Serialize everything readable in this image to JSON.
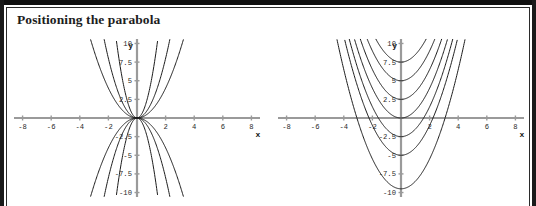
{
  "figure": {
    "title": "Positioning the parabola",
    "background_color": "#ffffff",
    "frame_color": "#101010",
    "axis_color": "#9a9a9a",
    "curve_color": "#1c1c1c"
  },
  "chart_data": [
    {
      "type": "line",
      "id": "left-plot",
      "title": "",
      "xlabel": "x",
      "ylabel": "y",
      "xlim": [
        -8.6,
        8.6
      ],
      "ylim": [
        -10.6,
        10.6
      ],
      "grid": false,
      "legend": "none",
      "xticks": [
        -8,
        -6,
        -4,
        -2,
        2,
        4,
        6,
        8
      ],
      "xtick_labels": [
        "-8",
        "-6",
        "-4",
        "-2",
        "2",
        "4",
        "6",
        "8"
      ],
      "yticks": [
        10,
        7.5,
        5,
        2.5,
        -2.5,
        -5,
        -7.5,
        -10
      ],
      "ytick_labels": [
        "10",
        "7.5",
        "5",
        "2.5",
        "-2.5",
        "-5",
        "-7.5",
        "-10"
      ],
      "description": "Family of parabolas y = a*x^2 through the origin, with both positive and negative coefficients a.",
      "series": [
        {
          "name": "y = 5x^2",
          "form": "a*x^2",
          "a": 5,
          "values": []
        },
        {
          "name": "y = 2x^2",
          "form": "a*x^2",
          "a": 2,
          "values": []
        },
        {
          "name": "y = x^2",
          "form": "a*x^2",
          "a": 1,
          "values": []
        },
        {
          "name": "y = -x^2",
          "form": "a*x^2",
          "a": -1,
          "values": []
        },
        {
          "name": "y = -2x^2",
          "form": "a*x^2",
          "a": -2,
          "values": []
        },
        {
          "name": "y = -5x^2",
          "form": "a*x^2",
          "a": -5,
          "values": []
        }
      ]
    },
    {
      "type": "line",
      "id": "right-plot",
      "title": "",
      "xlabel": "x",
      "ylabel": "y",
      "xlim": [
        -8.6,
        8.6
      ],
      "ylim": [
        -10.6,
        10.6
      ],
      "grid": false,
      "legend": "none",
      "xticks": [
        -8,
        -6,
        -4,
        -2,
        2,
        4,
        6,
        8
      ],
      "xtick_labels": [
        "-8",
        "-6",
        "-4",
        "-2",
        "2",
        "4",
        "6",
        "8"
      ],
      "yticks": [
        10,
        7.5,
        5,
        2.5,
        -2.5,
        -5,
        -7.5,
        -10
      ],
      "ytick_labels": [
        "10",
        "7.5",
        "5",
        "2.5",
        "-2.5",
        "-5",
        "-7.5",
        "-10"
      ],
      "description": "Family of parabolas y = x^2 + c, vertically shifted copies with vertices on the y-axis.",
      "series": [
        {
          "name": "y = x^2 + 7.5",
          "form": "x^2+c",
          "c": 7.5,
          "vertex": [
            0,
            7.5
          ],
          "values": []
        },
        {
          "name": "y = x^2 + 5",
          "form": "x^2+c",
          "c": 5,
          "vertex": [
            0,
            5
          ],
          "values": []
        },
        {
          "name": "y = x^2 + 2.5",
          "form": "x^2+c",
          "c": 2.5,
          "vertex": [
            0,
            2.5
          ],
          "values": []
        },
        {
          "name": "y = x^2",
          "form": "x^2+c",
          "c": 0,
          "vertex": [
            0,
            0
          ],
          "values": []
        },
        {
          "name": "y = x^2 - 2.5",
          "form": "x^2+c",
          "c": -2.5,
          "vertex": [
            0,
            -2.5
          ],
          "values": []
        },
        {
          "name": "y = x^2 - 5",
          "form": "x^2+c",
          "c": -5,
          "vertex": [
            0,
            -5
          ],
          "values": []
        },
        {
          "name": "y = x^2 - 9.5",
          "form": "x^2+c",
          "c": -9.5,
          "vertex": [
            0,
            -9.5
          ],
          "values": []
        }
      ]
    }
  ]
}
